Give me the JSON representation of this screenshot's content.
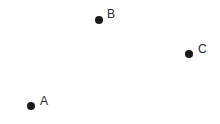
{
  "canvas": {
    "width": 220,
    "height": 124,
    "background_color": "#ffffff"
  },
  "style": {
    "dot_color": "#1a1a1a",
    "dot_diameter": 8,
    "label_color": "#2b2b2b",
    "label_font_size": 12
  },
  "chart_data": {
    "type": "scatter",
    "title": "",
    "subtitle": "",
    "xlabel": "",
    "ylabel": "",
    "xlim": [
      0,
      220
    ],
    "ylim": [
      0,
      124
    ],
    "grid": false,
    "axes_visible": false,
    "legend": null,
    "tick_labels_x": [],
    "tick_labels_y": [],
    "series": [
      {
        "name": "points",
        "marker": "circle",
        "color": "#1a1a1a",
        "points": [
          {
            "label": "A",
            "x": 31,
            "y": 106,
            "label_x": 40,
            "label_y": 95
          },
          {
            "label": "B",
            "x": 99,
            "y": 20,
            "label_x": 107,
            "label_y": 8
          },
          {
            "label": "C",
            "x": 189,
            "y": 54,
            "label_x": 198,
            "label_y": 43
          }
        ]
      }
    ],
    "annotations": [
      "A",
      "B",
      "C"
    ]
  }
}
